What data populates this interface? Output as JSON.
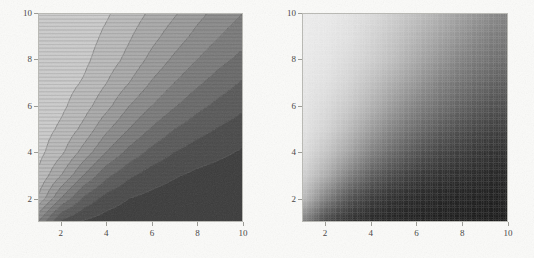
{
  "figure": {
    "background_color": "#fbfbf9",
    "panel_count": 2
  },
  "chart_data": [
    {
      "type": "heatmap",
      "subtype": "filled-contour",
      "title": "",
      "xlabel": "",
      "ylabel": "",
      "xlim": [
        1,
        10
      ],
      "ylim": [
        1,
        10
      ],
      "grid": false,
      "legend": "none",
      "colormap": "grayscale",
      "panel": "left",
      "xticks": [
        2,
        4,
        6,
        8,
        10
      ],
      "yticks": [
        2,
        4,
        6,
        8,
        10
      ],
      "xtick_labels": [
        "2",
        "4",
        "6",
        "8",
        "10"
      ],
      "ytick_labels": [
        "2",
        "4",
        "6",
        "8",
        "10"
      ],
      "contour_lines": true,
      "contour_levels": [
        0.1,
        0.2,
        0.3,
        0.4,
        0.5,
        0.6,
        0.7,
        0.8,
        0.9
      ],
      "level_colors": [
        "#3b3b3b",
        "#4a4a4a",
        "#5a5a5a",
        "#6b6b6b",
        "#7c7c7c",
        "#8c8c8c",
        "#9c9c9c",
        "#ababab",
        "#bcbcbc",
        "#cdcdcd"
      ],
      "description": "Discrete grayscale level plot; value decreases from upper-left (light) to lower-right (dark) along a diagonal front running from bottom-left to top-right.",
      "x": [
        1,
        2,
        3,
        4,
        5,
        6,
        7,
        8,
        9,
        10
      ],
      "y": [
        1,
        2,
        3,
        4,
        5,
        6,
        7,
        8,
        9,
        10
      ],
      "z": [
        [
          0.5,
          0.18,
          0.09,
          0.05,
          0.03,
          0.02,
          0.02,
          0.01,
          0.01,
          0.01
        ],
        [
          0.78,
          0.5,
          0.28,
          0.16,
          0.1,
          0.07,
          0.05,
          0.04,
          0.03,
          0.02
        ],
        [
          0.88,
          0.7,
          0.5,
          0.33,
          0.22,
          0.15,
          0.11,
          0.08,
          0.06,
          0.05
        ],
        [
          0.93,
          0.82,
          0.66,
          0.5,
          0.37,
          0.27,
          0.2,
          0.15,
          0.12,
          0.09
        ],
        [
          0.95,
          0.88,
          0.77,
          0.62,
          0.5,
          0.39,
          0.3,
          0.24,
          0.19,
          0.15
        ],
        [
          0.97,
          0.92,
          0.84,
          0.73,
          0.6,
          0.5,
          0.41,
          0.33,
          0.27,
          0.22
        ],
        [
          0.97,
          0.94,
          0.89,
          0.8,
          0.7,
          0.59,
          0.5,
          0.42,
          0.35,
          0.29
        ],
        [
          0.98,
          0.96,
          0.92,
          0.85,
          0.77,
          0.67,
          0.58,
          0.5,
          0.43,
          0.37
        ],
        [
          0.99,
          0.97,
          0.94,
          0.88,
          0.81,
          0.73,
          0.65,
          0.57,
          0.5,
          0.44
        ],
        [
          0.99,
          0.98,
          0.95,
          0.91,
          0.85,
          0.78,
          0.71,
          0.63,
          0.56,
          0.5
        ]
      ]
    },
    {
      "type": "heatmap",
      "subtype": "density",
      "title": "",
      "xlabel": "",
      "ylabel": "",
      "xlim": [
        1,
        10
      ],
      "ylim": [
        1,
        10
      ],
      "grid": false,
      "legend": "none",
      "colormap": "grayscale",
      "panel": "right",
      "xticks": [
        2,
        4,
        6,
        8,
        10
      ],
      "yticks": [
        2,
        4,
        6,
        8,
        10
      ],
      "xtick_labels": [
        "2",
        "4",
        "6",
        "8",
        "10"
      ],
      "ytick_labels": [
        "2",
        "4",
        "6",
        "8",
        "10"
      ],
      "contour_lines": false,
      "description": "Smooth continuous grayscale density plot of the same field; light band along the left/upper-left edge fading to near-black in the lower-right.",
      "x": [
        1,
        2,
        3,
        4,
        5,
        6,
        7,
        8,
        9,
        10
      ],
      "y": [
        1,
        2,
        3,
        4,
        5,
        6,
        7,
        8,
        9,
        10
      ],
      "z": [
        [
          0.48,
          0.2,
          0.1,
          0.06,
          0.04,
          0.03,
          0.02,
          0.02,
          0.01,
          0.01
        ],
        [
          0.76,
          0.48,
          0.27,
          0.16,
          0.1,
          0.07,
          0.05,
          0.04,
          0.03,
          0.03
        ],
        [
          0.86,
          0.69,
          0.48,
          0.32,
          0.22,
          0.15,
          0.11,
          0.09,
          0.07,
          0.05
        ],
        [
          0.91,
          0.8,
          0.65,
          0.48,
          0.36,
          0.27,
          0.2,
          0.16,
          0.12,
          0.1
        ],
        [
          0.94,
          0.87,
          0.75,
          0.61,
          0.48,
          0.38,
          0.3,
          0.24,
          0.19,
          0.16
        ],
        [
          0.95,
          0.9,
          0.82,
          0.71,
          0.59,
          0.48,
          0.4,
          0.33,
          0.27,
          0.23
        ],
        [
          0.96,
          0.93,
          0.87,
          0.78,
          0.68,
          0.58,
          0.48,
          0.41,
          0.35,
          0.3
        ],
        [
          0.97,
          0.95,
          0.9,
          0.84,
          0.76,
          0.66,
          0.57,
          0.48,
          0.42,
          0.37
        ],
        [
          0.98,
          0.96,
          0.93,
          0.87,
          0.8,
          0.72,
          0.64,
          0.56,
          0.48,
          0.43
        ],
        [
          0.98,
          0.97,
          0.94,
          0.9,
          0.84,
          0.77,
          0.7,
          0.62,
          0.55,
          0.48
        ]
      ],
      "value_color_range": [
        "#141414",
        "#f2f2f2"
      ]
    }
  ]
}
